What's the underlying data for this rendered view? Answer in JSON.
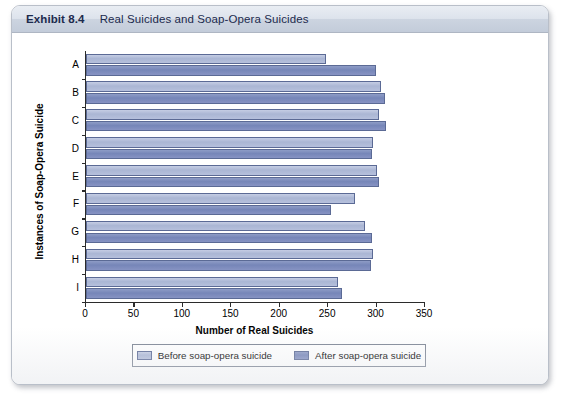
{
  "exhibit": {
    "label": "Exhibit 8.4",
    "title": "Real Suicides and Soap-Opera Suicides"
  },
  "chart_data": {
    "type": "bar",
    "orientation": "horizontal",
    "title": "Real Suicides and Soap-Opera Suicides",
    "categories": [
      "A",
      "B",
      "C",
      "D",
      "E",
      "F",
      "G",
      "H",
      "I"
    ],
    "series": [
      {
        "name": "Before soap-opera suicide",
        "color": "#aab6d4",
        "values": [
          248,
          305,
          303,
          296,
          300,
          278,
          288,
          296,
          260
        ]
      },
      {
        "name": "After soap-opera suicide",
        "color": "#7686b8",
        "values": [
          299,
          309,
          310,
          295,
          303,
          253,
          295,
          294,
          264
        ]
      }
    ],
    "xlabel": "Number of Real Suicides",
    "ylabel": "Instances of Soap-Opera Suicide",
    "xlim": [
      0,
      350
    ],
    "xticks": [
      0,
      50,
      100,
      150,
      200,
      250,
      300,
      350
    ],
    "xtick_labels": [
      "0",
      "50",
      "100",
      "150",
      "200",
      "250",
      "300",
      "350"
    ],
    "grid": false,
    "legend_position": "bottom"
  }
}
